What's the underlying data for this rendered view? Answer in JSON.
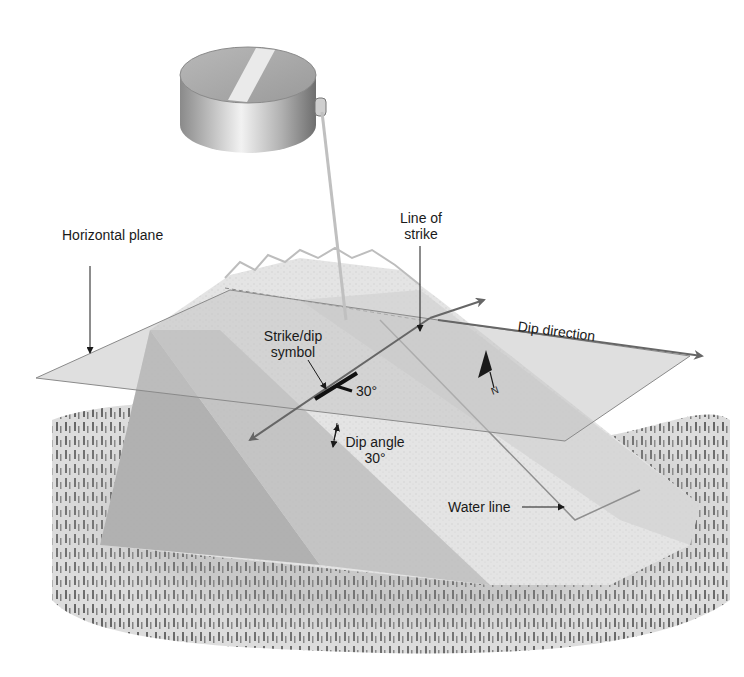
{
  "diagram": {
    "type": "geologic-block-diagram",
    "labels": {
      "horizontal_plane": "Horizontal plane",
      "line_of_strike_1": "Line of",
      "line_of_strike_2": "strike",
      "strike_dip_symbol_1": "Strike/dip",
      "strike_dip_symbol_2": "symbol",
      "symbol_angle": "30°",
      "dip_direction": "Dip direction",
      "dip_angle_1": "Dip angle",
      "dip_angle_2": "30°",
      "water_line": "Water line",
      "north": "N"
    },
    "values": {
      "dip_angle_degrees": 30
    },
    "colors": {
      "background": "#ffffff",
      "plane_fill": "#c8c8c8",
      "rock_light": "#e2e2e2",
      "rock_mid": "#bdbdbd",
      "rock_dark": "#a4a4a4",
      "arrow": "#666666",
      "text": "#1a1a1a",
      "forest": "#7a7a7a"
    }
  }
}
